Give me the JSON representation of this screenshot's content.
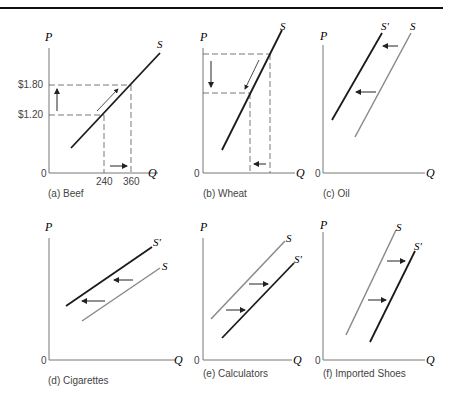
{
  "figure": {
    "colors": {
      "original_curve": "#8a8a8a",
      "shifted_curve": "#1a1a1a",
      "axis": "#777777",
      "rule": "#111111"
    },
    "axes": {
      "y": "P",
      "x": "Q",
      "origin": "0"
    },
    "panels": [
      {
        "id": "a",
        "caption": "(a) Beef",
        "curve": "S",
        "price_ticks": [
          "$1.80",
          "$1.20"
        ],
        "quantity_ticks": [
          "240",
          "360"
        ],
        "note": "Movement along supply curve: price rises from $1.20 to $1.80, quantity supplied rises from 240 to 360"
      },
      {
        "id": "b",
        "caption": "(b) Wheat",
        "curve": "S",
        "note": "Movement along supply curve: price falls, quantity supplied falls"
      },
      {
        "id": "c",
        "caption": "(c) Oil",
        "curves": [
          "S'",
          "S"
        ],
        "note": "Supply decreases: curve shifts left from S to S'"
      },
      {
        "id": "d",
        "caption": "(d) Cigarettes",
        "curves": [
          "S'",
          "S"
        ],
        "note": "Supply decreases: curve shifts left from S to S'"
      },
      {
        "id": "e",
        "caption": "(e) Calculators",
        "curves": [
          "S",
          "S'"
        ],
        "note": "Supply increases: curve shifts right from S to S'"
      },
      {
        "id": "f",
        "caption": "(f) Imported Shoes",
        "curves": [
          "S",
          "S'"
        ],
        "note": "Supply increases: curve shifts right from S to S'"
      }
    ]
  }
}
